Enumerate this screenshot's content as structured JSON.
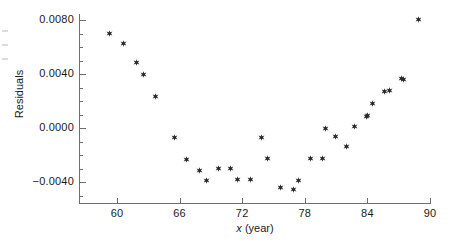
{
  "chart_data": {
    "type": "scatter",
    "title": "",
    "xlabel": "x (year)",
    "ylabel": "Residuals",
    "xlim": [
      57.5,
      91.5
    ],
    "ylim": [
      -0.0056,
      0.0092
    ],
    "grid": false,
    "legend": null,
    "marker": "star",
    "marker_color": "#2b2b2b",
    "xticks": [
      60,
      66,
      72,
      78,
      84,
      90
    ],
    "xtick_labels": [
      "60",
      "66",
      "72",
      "78",
      "84",
      "90"
    ],
    "yticks": [
      -0.004,
      0.0,
      0.004,
      0.008
    ],
    "ytick_labels": [
      "−0.0040",
      "0.0000",
      "0.0040",
      "0.0080"
    ],
    "y_minor_tick_step": 0.001,
    "points": [
      {
        "x": 59.3,
        "y": 0.00704
      },
      {
        "x": 60.6,
        "y": 0.0063
      },
      {
        "x": 61.9,
        "y": 0.00482
      },
      {
        "x": 62.5,
        "y": 0.00393
      },
      {
        "x": 63.7,
        "y": 0.00237
      },
      {
        "x": 65.5,
        "y": -0.00067
      },
      {
        "x": 66.7,
        "y": -0.0023
      },
      {
        "x": 67.9,
        "y": -0.00311
      },
      {
        "x": 68.6,
        "y": -0.00385
      },
      {
        "x": 69.7,
        "y": -0.00296
      },
      {
        "x": 70.9,
        "y": -0.00296
      },
      {
        "x": 71.5,
        "y": -0.00378
      },
      {
        "x": 72.8,
        "y": -0.00378
      },
      {
        "x": 73.8,
        "y": -0.00067
      },
      {
        "x": 74.4,
        "y": -0.00222
      },
      {
        "x": 75.7,
        "y": -0.00444
      },
      {
        "x": 76.9,
        "y": -0.00452
      },
      {
        "x": 77.4,
        "y": -0.00385
      },
      {
        "x": 78.5,
        "y": -0.00222
      },
      {
        "x": 79.7,
        "y": -0.00222
      },
      {
        "x": 80.0,
        "y": 0.0
      },
      {
        "x": 80.9,
        "y": -0.00059
      },
      {
        "x": 82.0,
        "y": -0.00133
      },
      {
        "x": 82.8,
        "y": 0.00015
      },
      {
        "x": 83.9,
        "y": 0.00089
      },
      {
        "x": 84.0,
        "y": 0.00096
      },
      {
        "x": 84.5,
        "y": 0.00185
      },
      {
        "x": 85.6,
        "y": 0.00274
      },
      {
        "x": 86.1,
        "y": 0.00281
      },
      {
        "x": 87.3,
        "y": 0.0037
      },
      {
        "x": 87.5,
        "y": 0.00363
      },
      {
        "x": 88.9,
        "y": 0.00807
      }
    ]
  }
}
